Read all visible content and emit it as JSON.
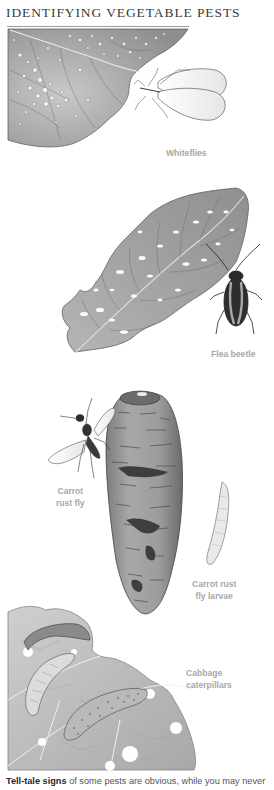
{
  "page": {
    "title": "IDENTIFYING VEGETABLE PESTS"
  },
  "labels": {
    "whiteflies": "Whiteflies",
    "flea_beetle": "Flea beetle",
    "carrot_rust_fly_line1": "Carrot",
    "carrot_rust_fly_line2": "rust fly",
    "carrot_rust_fly_larvae_line1": "Carrot rust",
    "carrot_rust_fly_larvae_line2": "fly larvae",
    "cabbage_caterpillars_line1": "Cabbage",
    "cabbage_caterpillars_line2": "caterpillars"
  },
  "caption": {
    "lead": "Tell-tale signs",
    "rest": " of some pests are obvious, while you may never"
  },
  "colors": {
    "label_gray": "#a8a8a8",
    "title_gray": "#3a3a3a",
    "leaf_gray": "#a9a9a9"
  }
}
